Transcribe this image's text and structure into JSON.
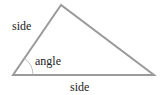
{
  "diagram": {
    "type": "triangle",
    "labels": {
      "left_side": "side",
      "angle": "angle",
      "bottom_side": "side"
    },
    "colors": {
      "stroke": "#9a9a9a",
      "arc": "#b0b0b0",
      "text": "#222222",
      "background": "#ffffff"
    },
    "vertices": {
      "apex": [
        61,
        5
      ],
      "bottom_left": [
        13,
        75
      ],
      "bottom_right": [
        154,
        75
      ]
    }
  }
}
